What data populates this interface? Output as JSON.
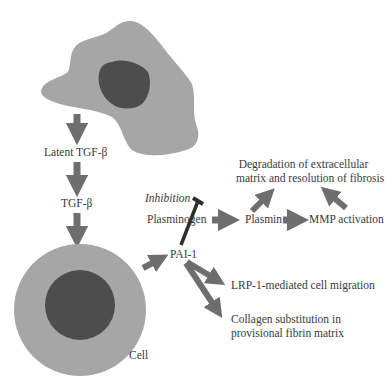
{
  "diagram": {
    "colors": {
      "cytoplasm": "#a6a6a6",
      "nucleus": "#4d4d4d",
      "arrow": "#6e6e6e",
      "inhibitor": "#2e2e2e",
      "text": "#3a3a3a",
      "background": "#ffffff"
    },
    "nodes": {
      "latent_tgfb": "Latent TGF-β",
      "tgfb": "TGF-β",
      "cell": "Cell",
      "pai1": "PAI-1",
      "inhibition": "Inhibition",
      "plasminogen": "Plasminogen",
      "plasmin": "Plasmin",
      "mmp_activation": "MMP activation",
      "degradation_line1": "Degradation of extracellular",
      "degradation_line2": "matrix and resolution of fibrosis",
      "lrp1": "LRP-1-mediated cell migration",
      "collagen_line1": "Collagen substitution in",
      "collagen_line2": "provisional fibrin matrix"
    },
    "edges": [
      {
        "from": "source cell",
        "to": "Latent TGF-β",
        "type": "arrow"
      },
      {
        "from": "Latent TGF-β",
        "to": "TGF-β",
        "type": "arrow"
      },
      {
        "from": "TGF-β",
        "to": "Cell",
        "type": "arrow"
      },
      {
        "from": "Cell",
        "to": "PAI-1",
        "type": "arrow"
      },
      {
        "from": "PAI-1",
        "to": "Plasminogen → Plasmin",
        "type": "inhibition"
      },
      {
        "from": "Plasminogen",
        "to": "Plasmin",
        "type": "arrow"
      },
      {
        "from": "Plasmin",
        "to": "MMP activation",
        "type": "arrow"
      },
      {
        "from": "Plasmin",
        "to": "Degradation of extracellular matrix and resolution of fibrosis",
        "type": "arrow"
      },
      {
        "from": "MMP activation",
        "to": "Degradation of extracellular matrix and resolution of fibrosis",
        "type": "arrow"
      },
      {
        "from": "PAI-1",
        "to": "LRP-1-mediated cell migration",
        "type": "arrow"
      },
      {
        "from": "PAI-1",
        "to": "Collagen substitution in provisional fibrin matrix",
        "type": "arrow"
      }
    ]
  }
}
